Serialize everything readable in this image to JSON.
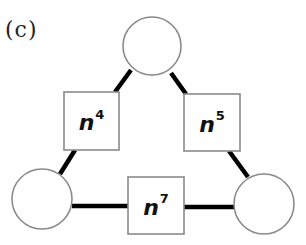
{
  "panel_label": "(c)",
  "colors": {
    "background": "#ffffff",
    "node_stroke": "#8a8a8a",
    "edge": "#000000",
    "text": "#111111"
  },
  "circles": [
    {
      "id": "top",
      "cx": 152,
      "cy": 46,
      "r": 29
    },
    {
      "id": "bottom-left",
      "cx": 42,
      "cy": 199,
      "r": 30
    },
    {
      "id": "bottom-right",
      "cx": 264,
      "cy": 204,
      "r": 30
    }
  ],
  "boxes": [
    {
      "id": "left",
      "x": 64,
      "y": 92,
      "w": 55,
      "h": 58,
      "base": "n",
      "exponent": "4"
    },
    {
      "id": "right",
      "x": 184,
      "y": 94,
      "w": 56,
      "h": 57,
      "base": "n",
      "exponent": "5"
    },
    {
      "id": "bottom",
      "x": 128,
      "y": 177,
      "w": 56,
      "h": 57,
      "base": "n",
      "exponent": "7"
    }
  ],
  "edges": [
    {
      "from": "top",
      "to": "left",
      "x1": 131,
      "y1": 70,
      "x2": 115,
      "y2": 92
    },
    {
      "from": "top",
      "to": "right",
      "x1": 171,
      "y1": 73,
      "x2": 186,
      "y2": 94
    },
    {
      "from": "left",
      "to": "bottom-left",
      "x1": 75,
      "y1": 150,
      "x2": 60,
      "y2": 174
    },
    {
      "from": "right",
      "to": "bottom-right",
      "x1": 229,
      "y1": 151,
      "x2": 248,
      "y2": 177
    },
    {
      "from": "bottom-left",
      "to": "bottom",
      "x1": 72,
      "y1": 206,
      "x2": 128,
      "y2": 206
    },
    {
      "from": "bottom",
      "to": "bottom-right",
      "x1": 184,
      "y1": 207,
      "x2": 234,
      "y2": 207
    }
  ]
}
